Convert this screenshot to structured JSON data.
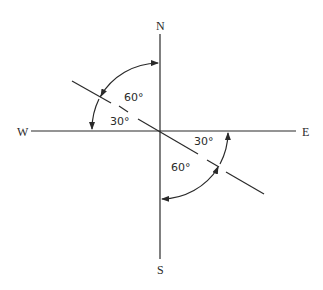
{
  "diagram": {
    "type": "compass-angle-diagram",
    "compass_labels": {
      "north": "N",
      "south": "S",
      "east": "E",
      "west": "W"
    },
    "angles": [
      {
        "label": "60°",
        "region": "upper-left, between line and N axis"
      },
      {
        "label": "30°",
        "region": "upper-left, between line and W axis"
      },
      {
        "label": "30°",
        "region": "lower-right, between line and E axis"
      },
      {
        "label": "60°",
        "region": "lower-right, between line and S axis"
      }
    ],
    "line_description": "Line through origin oriented 30° below the horizontal (NW to SE), drawn partially dashed",
    "arcs": [
      {
        "quadrant": "NW",
        "from": "N",
        "to": "W",
        "radius_px": 68
      },
      {
        "quadrant": "SE",
        "from": "E",
        "to": "S",
        "radius_px": 68
      }
    ],
    "colors": {
      "ink": "#2a2a2a",
      "background": "#ffffff"
    }
  }
}
